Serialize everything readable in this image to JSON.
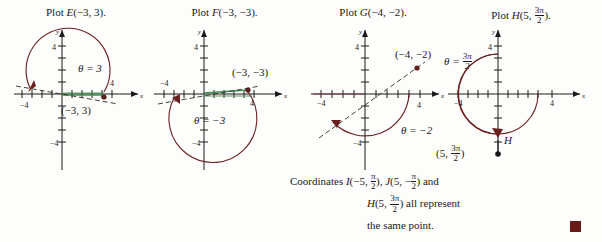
{
  "figure": {
    "background_color": "#fdfdfb",
    "axis_color": "#1a1a1a",
    "arc_color": "#6b2020",
    "segment_color": "#3f8f4f",
    "point_color": "#5a1f1f",
    "endmark_color": "#6b1a1a"
  },
  "panels": [
    {
      "id": "panel-e",
      "title_prefix": "Plot ",
      "title_symbol": "E",
      "title_args": "(−3, 3).",
      "theta_label": "θ = 3",
      "point_label": "(−3, 3)",
      "axis_x_min_label": "−4",
      "axis_x_max_label": "4",
      "axis_y_max_label": "4",
      "axis_y_min_label": "−4",
      "x_axis_name": "x",
      "y_axis_name": "y",
      "r": -3,
      "theta": 3,
      "arc_direction": "counterclockwise"
    },
    {
      "id": "panel-f",
      "title_prefix": "Plot ",
      "title_symbol": "F",
      "title_args": "(−3, −3).",
      "theta_label": "θ = −3",
      "point_label": "(−3, −3)",
      "axis_x_min_label": "−4",
      "axis_x_max_label": "4",
      "axis_y_max_label": "4",
      "axis_y_min_label": "−4",
      "x_axis_name": "x",
      "y_axis_name": "y",
      "r": -3,
      "theta": -3,
      "arc_direction": "clockwise"
    },
    {
      "id": "panel-g",
      "title_prefix": "Plot ",
      "title_symbol": "G",
      "title_args": "(−4, −2).",
      "theta_label": "θ = −2",
      "point_label": "(−4, −2)",
      "axis_x_min_label": "−4",
      "axis_x_max_label": "4",
      "axis_y_max_label": "4",
      "axis_y_min_label": "−4",
      "x_axis_name": "x",
      "y_axis_name": "y",
      "r": -4,
      "theta": -2,
      "arc_direction": "clockwise"
    },
    {
      "id": "panel-h",
      "title_prefix": "Plot ",
      "title_symbol": "H",
      "title_args_pre": "(5, ",
      "title_frac_num": "3π",
      "title_frac_den": "2",
      "title_args_post": ").",
      "theta_label_pre": "θ = ",
      "theta_frac_num": "3π",
      "theta_frac_den": "2",
      "point_label_pre": "(5, ",
      "point_frac_num": "3π",
      "point_frac_den": "2",
      "point_label_post": ")",
      "point_marker_label": "H",
      "axis_x_min_label": "−4",
      "axis_x_max_label": "4",
      "axis_y_max_label": "4",
      "x_axis_name": "x",
      "y_axis_name": "y",
      "r": 5,
      "theta": 4.712,
      "arc_direction": "clockwise"
    }
  ],
  "note": {
    "line1_lead": "Coordinates ",
    "line1_i_symbol": "I",
    "line1_i_pre": "(−5, ",
    "line1_i_num": "π",
    "line1_i_den": "2",
    "line1_i_post": "), ",
    "line1_j_symbol": "J",
    "line1_j_pre": "(5, −",
    "line1_j_num": "π",
    "line1_j_den": "2",
    "line1_j_post": ") and",
    "line2_h_symbol": "H",
    "line2_h_pre": "(5, ",
    "line2_h_num": "3π",
    "line2_h_den": "2",
    "line2_h_post": ") all represent",
    "line3": "the same point."
  }
}
